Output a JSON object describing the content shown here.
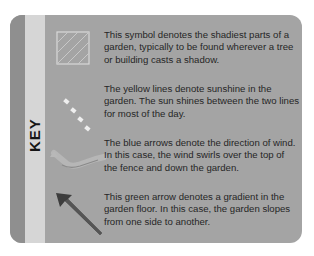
{
  "key": {
    "title": "KEY",
    "colors": {
      "card_bg": "#a4a4a4",
      "strip_dark": "#8f8f8f",
      "strip_light": "#d6d6d6",
      "text": "#262626",
      "shade_icon": "#d9d9d9",
      "sun_icon": "#efefef",
      "wind_icon": "#8a8a8a",
      "slope_icon": "#3d3d3d"
    },
    "entries": [
      {
        "icon": "hatched-square-icon",
        "text": "This symbol denotes the shadiest parts of a garden, typically to be found wherever a tree or building casts a shadow."
      },
      {
        "icon": "dashed-line-icon",
        "text": "The yellow lines denote sunshine in the garden. The sun shines between the two lines for most of the day."
      },
      {
        "icon": "curved-arrow-icon",
        "text": "The blue arrows denote the direction of wind. In this case, the wind swirls over the top of the fence and down the garden."
      },
      {
        "icon": "diagonal-arrow-icon",
        "text": "This green arrow denotes a gradient in the garden floor. In this case, the garden slopes from one side to another."
      }
    ]
  }
}
